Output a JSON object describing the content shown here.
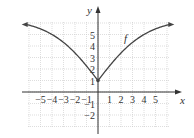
{
  "chart_data": {
    "type": "line",
    "title": "",
    "xlabel": "x",
    "ylabel": "y",
    "series": [
      {
        "name": "f",
        "x": [
          -7,
          -6,
          -5,
          -4,
          -3,
          -2,
          -1,
          0,
          1,
          2,
          3,
          4,
          5,
          6,
          7
        ],
        "values": [
          6.3,
          6.0,
          5.3,
          4.5,
          3.6,
          2.7,
          1.9,
          1.0,
          1.9,
          2.8,
          3.7,
          4.6,
          5.4,
          6.0,
          6.3
        ]
      }
    ],
    "x_ticks": [
      -5,
      -4,
      -3,
      -2,
      -1,
      1,
      2,
      3,
      4,
      5
    ],
    "y_ticks": [
      -2,
      -1,
      1,
      2,
      3,
      4,
      5
    ],
    "x_tick_labels": [
      "−5",
      "−4",
      "−3",
      "−2",
      "−1",
      "1",
      "2",
      "3",
      "4",
      "5"
    ],
    "y_tick_labels": [
      "−2",
      "−1",
      "1",
      "2",
      "3",
      "4",
      "5"
    ],
    "xlim": [
      -6,
      6
    ],
    "ylim": [
      -3,
      6
    ],
    "grid": true,
    "annotations": [
      {
        "text": "f",
        "x": 2.3,
        "y": 4.7
      },
      {
        "marker": "point",
        "x": 0,
        "y": 1
      }
    ],
    "asymptotic_arrows": "both ends"
  },
  "labels": {
    "x_axis": "x",
    "y_axis": "y",
    "curve": "f"
  }
}
